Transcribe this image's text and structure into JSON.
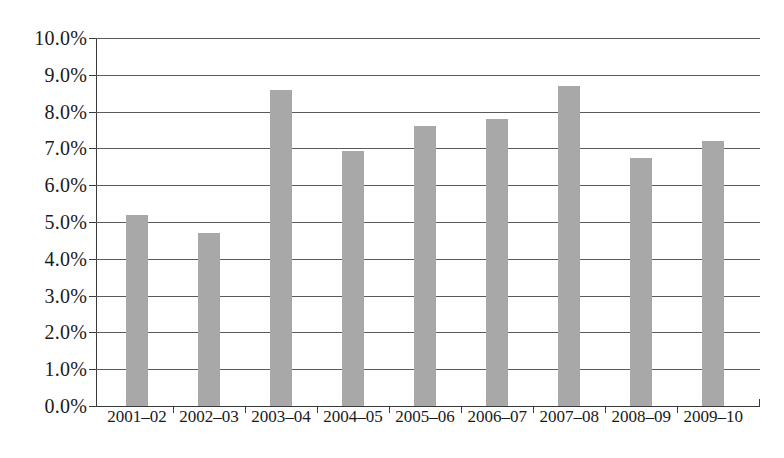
{
  "chart_data": {
    "type": "bar",
    "title": "",
    "subtitle": "",
    "xlabel": "",
    "ylabel": "",
    "categories": [
      "2001–02",
      "2002–03",
      "2003–04",
      "2004–05",
      "2005–06",
      "2006–07",
      "2007–08",
      "2008–09",
      "2009–10"
    ],
    "values": [
      5.2,
      4.7,
      8.6,
      6.93,
      7.6,
      7.8,
      8.7,
      6.75,
      7.2
    ],
    "value_unit": "%",
    "ylim": [
      0,
      10
    ],
    "ytick_step": 1,
    "ytick_labels": [
      "0.0%",
      "1.0%",
      "2.0%",
      "3.0%",
      "4.0%",
      "5.0%",
      "6.0%",
      "7.0%",
      "8.0%",
      "9.0%",
      "10.0%"
    ],
    "ytick_values": [
      0,
      1,
      2,
      3,
      4,
      5,
      6,
      7,
      8,
      9,
      10
    ],
    "grid": true,
    "grid_axis": "y",
    "legend": false,
    "legend_position": "none",
    "bar_color": "#a8a8a8",
    "axis_color": "#3a3a3a",
    "gridline_color": "#5a5a5a",
    "background_color": "#ffffff"
  }
}
